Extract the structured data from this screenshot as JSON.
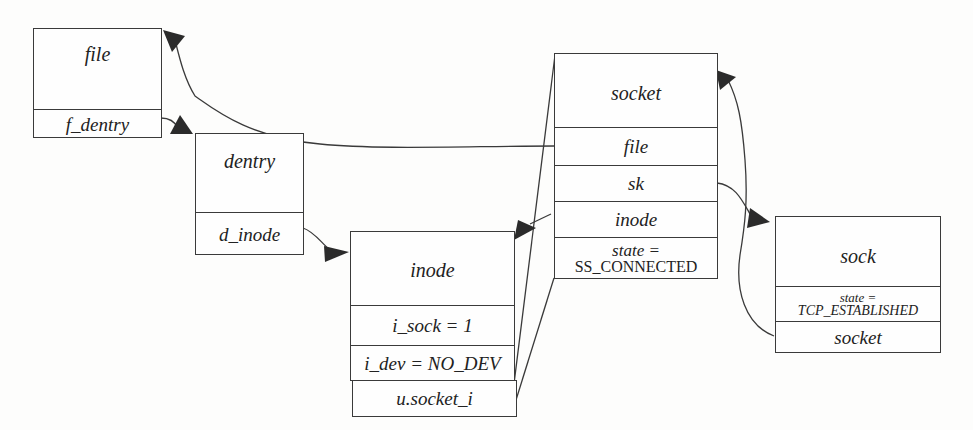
{
  "diagram": {
    "nodes": {
      "file": {
        "title": "file",
        "fields": [
          "f_dentry"
        ]
      },
      "dentry": {
        "title": "dentry",
        "fields": [
          "d_inode"
        ]
      },
      "inode": {
        "title": "inode",
        "fields": [
          "i_sock = 1",
          "i_dev = NO_DEV",
          "u.socket_i"
        ]
      },
      "socket": {
        "title": "socket",
        "fields": [
          "file",
          "sk",
          "inode"
        ],
        "state_label": "state =",
        "state_value": "SS_CONNECTED"
      },
      "sock": {
        "title": "sock",
        "state_label": "state =",
        "state_value": "TCP_ESTABLISHED",
        "fields": [
          "socket"
        ]
      }
    },
    "edges": [
      {
        "from": "file.f_dentry",
        "to": "dentry"
      },
      {
        "from": "dentry.d_inode",
        "to": "inode"
      },
      {
        "from": "socket.file",
        "to": "file"
      },
      {
        "from": "socket.sk",
        "to": "sock"
      },
      {
        "from": "socket.inode",
        "to": "inode"
      },
      {
        "from": "sock.socket",
        "to": "socket"
      },
      {
        "from": "inode.u.socket_i",
        "to": "socket"
      }
    ],
    "colors": {
      "line": "#3a3a3a",
      "arrow": "#2b2b2b",
      "background": "#fdfdfc"
    }
  }
}
